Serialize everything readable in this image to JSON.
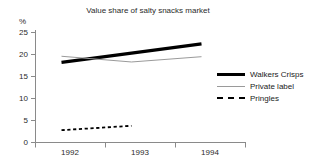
{
  "chart_data": {
    "type": "line",
    "title": "Value share of salty snacks market",
    "xlabel": "",
    "ylabel": "%",
    "categories": [
      "1992",
      "1993",
      "1994"
    ],
    "ylim": [
      0,
      25
    ],
    "yticks": [
      "0",
      "5",
      "10",
      "15",
      "20",
      "25"
    ],
    "grid": false,
    "legend_position": "right",
    "series": [
      {
        "name": "Walkers Crisps",
        "values": [
          18.2,
          20.3,
          22.4
        ],
        "style": "thick-solid",
        "color": "#000000"
      },
      {
        "name": "Private label",
        "values": [
          19.6,
          18.3,
          19.5
        ],
        "style": "thin-solid",
        "color": "#9a9a9a"
      },
      {
        "name": "Pringles",
        "values": [
          2.8,
          3.8,
          null
        ],
        "style": "dashed",
        "color": "#000000"
      }
    ]
  },
  "axis": {
    "y_unit_label": "%",
    "y_tick_labels": [
      "25",
      "20",
      "15",
      "10",
      "5",
      "0"
    ],
    "x_tick_labels": [
      "1992",
      "1993",
      "1994"
    ]
  },
  "legend": {
    "items": [
      {
        "label": "Walkers Crisps",
        "swatch": "thick-line-swatch"
      },
      {
        "label": "Private label",
        "swatch": "thin-line-swatch"
      },
      {
        "label": "Pringles",
        "swatch": "dashed-line-swatch"
      }
    ]
  },
  "title": {
    "text": "Value share of salty snacks market"
  }
}
